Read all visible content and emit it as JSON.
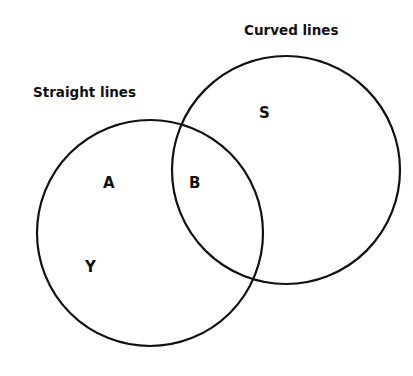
{
  "diagram": {
    "type": "venn",
    "sets": [
      {
        "id": "straight",
        "label": "Straight lines",
        "cx": 150,
        "cy": 233,
        "r": 113
      },
      {
        "id": "curved",
        "label": "Curved lines",
        "cx": 286,
        "cy": 170,
        "r": 114
      }
    ],
    "regions": [
      {
        "id": "A",
        "label": "A",
        "x": 109,
        "y": 188
      },
      {
        "id": "B",
        "label": "B",
        "x": 195,
        "y": 188
      },
      {
        "id": "S",
        "label": "S",
        "x": 264,
        "y": 117
      },
      {
        "id": "Y",
        "label": "Y",
        "x": 90,
        "y": 271
      }
    ],
    "stroke_color": "#111111",
    "background": "#ffffff"
  },
  "labels": {
    "straight_lines": "Straight lines",
    "curved_lines": "Curved lines",
    "region_a": "A",
    "region_b": "B",
    "region_s": "S",
    "region_y": "Y"
  }
}
